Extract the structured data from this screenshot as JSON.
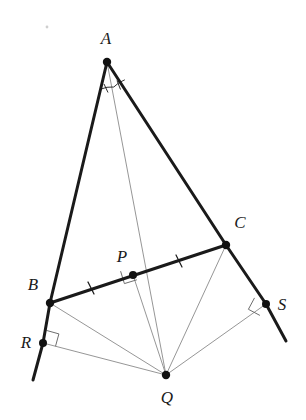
{
  "figure": {
    "type": "euclidean-geometry-diagram",
    "title": "",
    "canvas": {
      "width": 306,
      "height": 420,
      "background": "#ffffff"
    },
    "colors": {
      "thick_stroke": "#1a1a1a",
      "thin_stroke": "#8a8a8a",
      "point_fill": "#111111",
      "label_fill": "#1a1a1a",
      "background": "#ffffff"
    },
    "stroke_widths": {
      "thick": 3.0,
      "thin": 0.9,
      "mark": 1.0
    }
  },
  "points": [
    {
      "id": "A",
      "label": "A",
      "x": 107,
      "y": 62,
      "label_x": 106,
      "label_y": 44,
      "dot": true,
      "dot_r": 4.2
    },
    {
      "id": "B",
      "label": "B",
      "x": 50,
      "y": 303,
      "label_x": 33,
      "label_y": 290,
      "dot": true,
      "dot_r": 4.2
    },
    {
      "id": "C",
      "label": "C",
      "x": 226,
      "y": 245,
      "label_x": 240,
      "label_y": 228,
      "dot": true,
      "dot_r": 4.2
    },
    {
      "id": "P",
      "label": "P",
      "x": 133,
      "y": 275,
      "label_x": 122,
      "label_y": 262,
      "dot": true,
      "dot_r": 4.0
    },
    {
      "id": "Q",
      "label": "Q",
      "x": 166,
      "y": 375,
      "label_x": 167,
      "label_y": 403,
      "dot": true,
      "dot_r": 4.2
    },
    {
      "id": "R",
      "label": "R",
      "x": 43,
      "y": 343,
      "label_x": 26,
      "label_y": 345,
      "dot": true,
      "dot_r": 4.0
    },
    {
      "id": "S",
      "label": "S",
      "x": 266,
      "y": 304,
      "label_x": 281,
      "label_y": 310,
      "dot": true,
      "dot_r": 4.0
    }
  ],
  "segments": [
    {
      "id": "AB",
      "name": "side-ab",
      "from": "A",
      "to": "B",
      "weight": "thick"
    },
    {
      "id": "AC",
      "name": "side-ac",
      "from": "A",
      "to": "C",
      "weight": "thick"
    },
    {
      "id": "BC",
      "name": "side-bc",
      "from": "B",
      "to": "C",
      "weight": "thick"
    },
    {
      "id": "BR",
      "name": "extension-br",
      "from": "B",
      "to": "R",
      "weight": "thick"
    },
    {
      "id": "Rext",
      "name": "extension-below-r",
      "x1": 43,
      "y1": 343,
      "x2": 33,
      "y2": 380,
      "weight": "thick"
    },
    {
      "id": "CS",
      "name": "extension-cs",
      "from": "C",
      "to": "S",
      "weight": "thick"
    },
    {
      "id": "Sext",
      "name": "extension-below-s",
      "x1": 266,
      "y1": 304,
      "x2": 286,
      "y2": 341,
      "weight": "thick"
    },
    {
      "id": "AQ",
      "name": "cevian-aq",
      "from": "A",
      "to": "Q",
      "weight": "thin"
    },
    {
      "id": "PQ",
      "name": "perpendicular-pq",
      "from": "P",
      "to": "Q",
      "weight": "thin"
    },
    {
      "id": "BQ",
      "name": "segment-bq",
      "from": "B",
      "to": "Q",
      "weight": "thin"
    },
    {
      "id": "CQ",
      "name": "segment-cq",
      "from": "C",
      "to": "Q",
      "weight": "thin"
    },
    {
      "id": "RQ",
      "name": "perpendicular-rq",
      "from": "R",
      "to": "Q",
      "weight": "thin"
    },
    {
      "id": "SQ",
      "name": "perpendicular-sq",
      "from": "S",
      "to": "Q",
      "weight": "thin"
    }
  ],
  "marks": {
    "right_angles": [
      {
        "id": "ra-P",
        "name": "right-angle-at-p",
        "vertex_x": 133,
        "vertex_y": 275,
        "size": 13,
        "a_deg": 197,
        "b_deg": 107
      },
      {
        "id": "ra-R",
        "name": "right-angle-at-r",
        "vertex_x": 43,
        "vertex_y": 343,
        "size": 13,
        "a_deg": -75,
        "b_deg": 15
      },
      {
        "id": "ra-S",
        "name": "right-angle-at-s",
        "vertex_x": 266,
        "vertex_y": 304,
        "size": 13,
        "a_deg": 208,
        "b_deg": 118
      }
    ],
    "congruent_ticks": [
      {
        "id": "tick-BP",
        "name": "congruence-tick-bp",
        "x": 91,
        "y": 288,
        "angle_deg": -17,
        "length": 11
      },
      {
        "id": "tick-PC",
        "name": "congruence-tick-pc",
        "x": 179,
        "y": 261,
        "angle_deg": -17,
        "length": 11
      }
    ],
    "angle_arcs": [
      {
        "id": "arc-BAQ",
        "name": "angle-arc-baq",
        "vertex": "A",
        "radius": 28,
        "start_deg": 76,
        "end_deg": 99,
        "hatches": 1
      },
      {
        "id": "arc-QAC",
        "name": "angle-arc-qac",
        "vertex": "A",
        "radius": 28,
        "start_deg": 53,
        "end_deg": 76,
        "hatches": 1
      }
    ],
    "speck": {
      "id": "artifact-speck",
      "name": "scan-artifact-speck",
      "x": 47,
      "y": 27,
      "r": 1.4
    }
  },
  "labels": {
    "A": "A",
    "B": "B",
    "C": "C",
    "P": "P",
    "Q": "Q",
    "R": "R",
    "S": "S"
  }
}
